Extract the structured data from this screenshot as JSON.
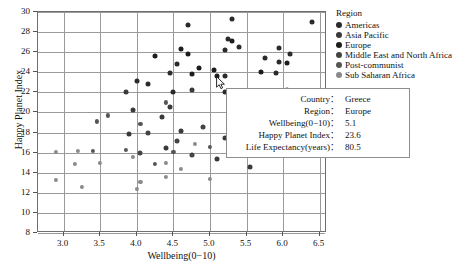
{
  "chart_data": {
    "type": "scatter",
    "title": "",
    "xlabel": "Wellbeing(0−10)",
    "ylabel": "Happy Planet Index",
    "xlim": [
      2.65,
      6.6
    ],
    "ylim": [
      8,
      30
    ],
    "xticks": [
      "3.0",
      "3.5",
      "4.0",
      "4.5",
      "5.0",
      "5.5",
      "6.0",
      "6.5"
    ],
    "xtick_values": [
      3.0,
      3.5,
      4.0,
      4.5,
      5.0,
      5.5,
      6.0,
      6.5
    ],
    "yticks": [
      "8",
      "10",
      "12",
      "14",
      "16",
      "18",
      "20",
      "22",
      "24",
      "26",
      "28",
      "30"
    ],
    "ytick_values": [
      8,
      10,
      12,
      14,
      16,
      18,
      20,
      22,
      24,
      26,
      28,
      30
    ],
    "grid": true,
    "legend_position": "right",
    "series": [
      {
        "name": "Americas",
        "color": "#2b2b2b",
        "points": [
          {
            "x": 4.7,
            "y": 28.7
          },
          {
            "x": 5.3,
            "y": 29.3
          },
          {
            "x": 6.4,
            "y": 29.0
          },
          {
            "x": 5.25,
            "y": 27.3
          },
          {
            "x": 5.4,
            "y": 26.5
          },
          {
            "x": 5.2,
            "y": 26.2
          },
          {
            "x": 5.95,
            "y": 26.4
          },
          {
            "x": 5.75,
            "y": 25.4
          },
          {
            "x": 5.95,
            "y": 25.0
          },
          {
            "x": 4.55,
            "y": 24.8
          },
          {
            "x": 4.45,
            "y": 23.9
          },
          {
            "x": 5.2,
            "y": 23.6
          },
          {
            "x": 5.9,
            "y": 23.9
          },
          {
            "x": 4.5,
            "y": 22.05
          },
          {
            "x": 5.2,
            "y": 22.05
          },
          {
            "x": 4.15,
            "y": 22.85
          },
          {
            "x": 4.0,
            "y": 23.15
          },
          {
            "x": 6.1,
            "y": 25.8
          }
        ]
      },
      {
        "name": "Asia Pacific",
        "color": "#3a3a3a",
        "points": [
          {
            "x": 4.45,
            "y": 20.5
          },
          {
            "x": 3.95,
            "y": 20.2
          },
          {
            "x": 4.75,
            "y": 22.2
          },
          {
            "x": 3.85,
            "y": 22.0
          },
          {
            "x": 4.35,
            "y": 19.5
          },
          {
            "x": 5.55,
            "y": 21.7
          },
          {
            "x": 6.05,
            "y": 22.2
          },
          {
            "x": 6.0,
            "y": 21.5
          },
          {
            "x": 4.6,
            "y": 18.2
          },
          {
            "x": 5.2,
            "y": 17.5
          },
          {
            "x": 4.4,
            "y": 16.5
          },
          {
            "x": 3.9,
            "y": 17.9
          },
          {
            "x": 5.1,
            "y": 15.4
          },
          {
            "x": 5.55,
            "y": 14.6
          }
        ]
      },
      {
        "name": "Europe",
        "color": "#1c1c1c",
        "points": [
          {
            "x": 4.6,
            "y": 26.3
          },
          {
            "x": 4.25,
            "y": 25.6
          },
          {
            "x": 4.7,
            "y": 25.8
          },
          {
            "x": 5.3,
            "y": 27.1
          },
          {
            "x": 5.05,
            "y": 24.2
          },
          {
            "x": 5.1,
            "y": 23.6
          },
          {
            "x": 4.75,
            "y": 23.8
          },
          {
            "x": 4.85,
            "y": 24.4
          },
          {
            "x": 5.7,
            "y": 24.0
          },
          {
            "x": 6.05,
            "y": 24.9
          }
        ]
      },
      {
        "name": "Middle East and North Africa",
        "color": "#444444",
        "points": [
          {
            "x": 4.15,
            "y": 18.0
          },
          {
            "x": 4.55,
            "y": 17.2
          },
          {
            "x": 4.9,
            "y": 18.6
          },
          {
            "x": 5.3,
            "y": 19.4
          },
          {
            "x": 4.05,
            "y": 16.0
          },
          {
            "x": 4.75,
            "y": 15.8
          },
          {
            "x": 5.85,
            "y": 17.9
          }
        ]
      },
      {
        "name": "Post-communist",
        "color": "#555555",
        "points": [
          {
            "x": 3.6,
            "y": 19.7
          },
          {
            "x": 3.45,
            "y": 19.1
          },
          {
            "x": 4.05,
            "y": 18.9
          },
          {
            "x": 4.4,
            "y": 21.0
          },
          {
            "x": 3.85,
            "y": 16.3
          },
          {
            "x": 4.5,
            "y": 16.1
          },
          {
            "x": 4.25,
            "y": 14.9
          },
          {
            "x": 5.0,
            "y": 16.6
          },
          {
            "x": 3.4,
            "y": 16.2
          }
        ]
      },
      {
        "name": "Sub Saharan Africa",
        "color": "#8a8a8a",
        "points": [
          {
            "x": 2.9,
            "y": 16.1
          },
          {
            "x": 3.2,
            "y": 16.2
          },
          {
            "x": 2.9,
            "y": 13.3
          },
          {
            "x": 3.25,
            "y": 12.6
          },
          {
            "x": 4.0,
            "y": 12.4
          },
          {
            "x": 3.15,
            "y": 14.9
          },
          {
            "x": 3.5,
            "y": 15.0
          },
          {
            "x": 4.4,
            "y": 13.6
          },
          {
            "x": 4.05,
            "y": 13.1
          },
          {
            "x": 4.6,
            "y": 14.4
          },
          {
            "x": 4.4,
            "y": 15.0
          },
          {
            "x": 5.0,
            "y": 13.4
          },
          {
            "x": 3.95,
            "y": 15.6
          },
          {
            "x": 4.8,
            "y": 16.9
          }
        ]
      }
    ]
  },
  "legend": {
    "title": "Region",
    "items": [
      {
        "label": "Americas",
        "color": "#2b2b2b"
      },
      {
        "label": "Asia Pacific",
        "color": "#3a3a3a"
      },
      {
        "label": "Europe",
        "color": "#1c1c1c"
      },
      {
        "label": "Middle East and North Africa",
        "color": "#444444"
      },
      {
        "label": "Post-communist",
        "color": "#555555"
      },
      {
        "label": "Sub Saharan Africa",
        "color": "#8a8a8a"
      }
    ]
  },
  "tooltip": {
    "rows": [
      {
        "key": "Country：",
        "value": "Greece"
      },
      {
        "key": "Region：",
        "value": "Europe"
      },
      {
        "key": "Wellbeing(0−10)：",
        "value": "5.1"
      },
      {
        "key": "Happy Planet Index：",
        "value": "23.6"
      },
      {
        "key": "Life Expectancy(years)：",
        "value": "80.5"
      }
    ]
  }
}
